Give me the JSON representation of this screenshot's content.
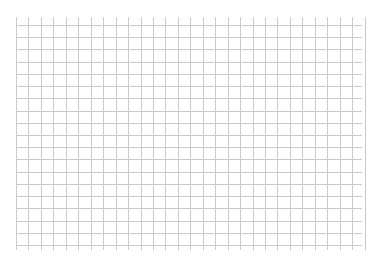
{
  "page": {
    "background": "#ffffff"
  },
  "grid": {
    "line_color": "#c9c9c9",
    "line_width": 1,
    "vertical_lines": {
      "count": 29,
      "start_x": 16,
      "spacing": 12.45,
      "top_y": 17,
      "bottom_y": 250
    },
    "horizontal_lines": {
      "count": 19,
      "start_y": 25,
      "spacing": 12.22,
      "left_x": 16,
      "right_x": 362
    }
  }
}
